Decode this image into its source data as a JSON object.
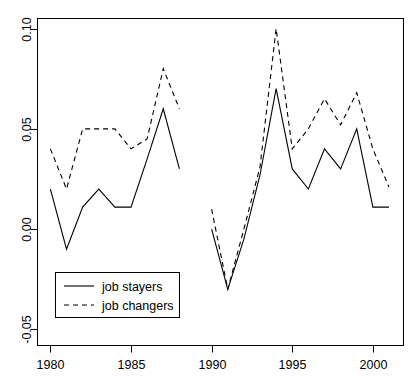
{
  "chart_data": {
    "type": "line",
    "title": "",
    "xlabel": "",
    "ylabel": "",
    "xlim": [
      1979.2,
      2001.9
    ],
    "ylim": [
      -0.058,
      0.105
    ],
    "grid": false,
    "legend_position": "bottom-left",
    "x_ticks": [
      1980,
      1985,
      1990,
      1995,
      2000
    ],
    "x_tick_labels": [
      "1980",
      "1985",
      "1990",
      "1995",
      "2000"
    ],
    "y_ticks": [
      -0.05,
      0.0,
      0.05,
      0.1
    ],
    "y_tick_labels": [
      "-0.05",
      "0.00",
      "0.05",
      "0.10"
    ],
    "series": [
      {
        "name": "job stayers",
        "style": "solid",
        "color": "#000000",
        "segments": [
          {
            "x": [
              1980,
              1981,
              1982,
              1983,
              1984,
              1985,
              1986,
              1987,
              1988
            ],
            "values": [
              0.02,
              -0.01,
              0.011,
              0.02,
              0.011,
              0.011,
              0.035,
              0.06,
              0.03
            ]
          },
          {
            "x": [
              1990,
              1991,
              1992,
              1993,
              1994,
              1995,
              1996,
              1997,
              1998,
              1999,
              2000,
              2001
            ],
            "values": [
              0.0,
              -0.03,
              -0.005,
              0.027,
              0.07,
              0.03,
              0.02,
              0.04,
              0.03,
              0.05,
              0.011,
              0.011
            ]
          }
        ]
      },
      {
        "name": "job changers",
        "style": "dashed",
        "color": "#000000",
        "segments": [
          {
            "x": [
              1980,
              1981,
              1982,
              1983,
              1984,
              1985,
              1986,
              1987,
              1988
            ],
            "values": [
              0.04,
              0.02,
              0.05,
              0.05,
              0.05,
              0.04,
              0.045,
              0.08,
              0.06
            ]
          },
          {
            "x": [
              1990,
              1991,
              1992,
              1993,
              1994,
              1995,
              1996,
              1997,
              1998,
              1999,
              2000,
              2001
            ],
            "values": [
              0.01,
              -0.03,
              0.0,
              0.031,
              0.1,
              0.04,
              0.05,
              0.065,
              0.052,
              0.068,
              0.04,
              0.021
            ]
          }
        ]
      }
    ]
  },
  "legend": {
    "entries": [
      {
        "label": "job stayers",
        "style": "solid"
      },
      {
        "label": "job changers",
        "style": "dashed"
      }
    ]
  }
}
